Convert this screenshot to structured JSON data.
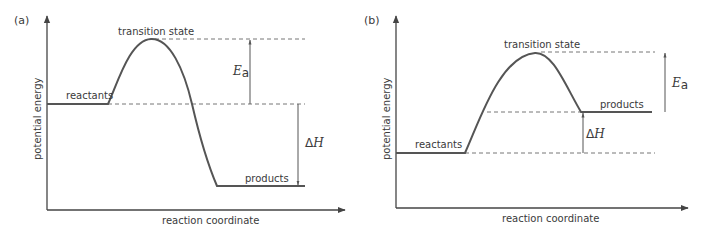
{
  "panels": [
    {
      "id": "a",
      "label": "(a)",
      "y_axis_label": "potential energy",
      "x_axis_label": "reaction coordinate",
      "reactants_label": "reactants",
      "transition_state_label": "transition state",
      "products_label": "products",
      "ea_symbol": "E",
      "ea_subscript": "a",
      "dh_delta": "Δ",
      "dh_symbol": "H",
      "type": "exothermic"
    },
    {
      "id": "b",
      "label": "(b)",
      "y_axis_label": "potential energy",
      "x_axis_label": "reaction coordinate",
      "reactants_label": "reactants",
      "transition_state_label": "transition state",
      "products_label": "products",
      "ea_symbol": "E",
      "ea_subscript": "a",
      "dh_delta": "Δ",
      "dh_symbol": "H",
      "type": "endothermic"
    }
  ],
  "colors": {
    "line": "#555555",
    "text": "#3a3a3a",
    "dash": "#777777",
    "background": "#ffffff"
  }
}
